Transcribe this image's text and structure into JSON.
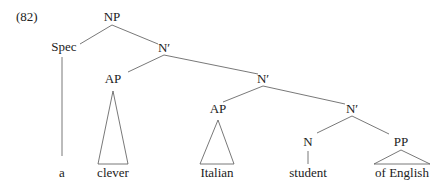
{
  "example_number": "(82)",
  "nodes": {
    "np": "NP",
    "spec": "Spec",
    "nbar1": "N′",
    "ap1": "AP",
    "nbar2": "N′",
    "ap2": "AP",
    "nbar3": "N′",
    "n": "N",
    "pp": "PP"
  },
  "leaves": {
    "a": "a",
    "clever": "clever",
    "italian": "Italian",
    "student": "student",
    "of_english": "of English"
  },
  "colors": {
    "line": "#555555",
    "text": "#222222",
    "background": "#ffffff"
  }
}
